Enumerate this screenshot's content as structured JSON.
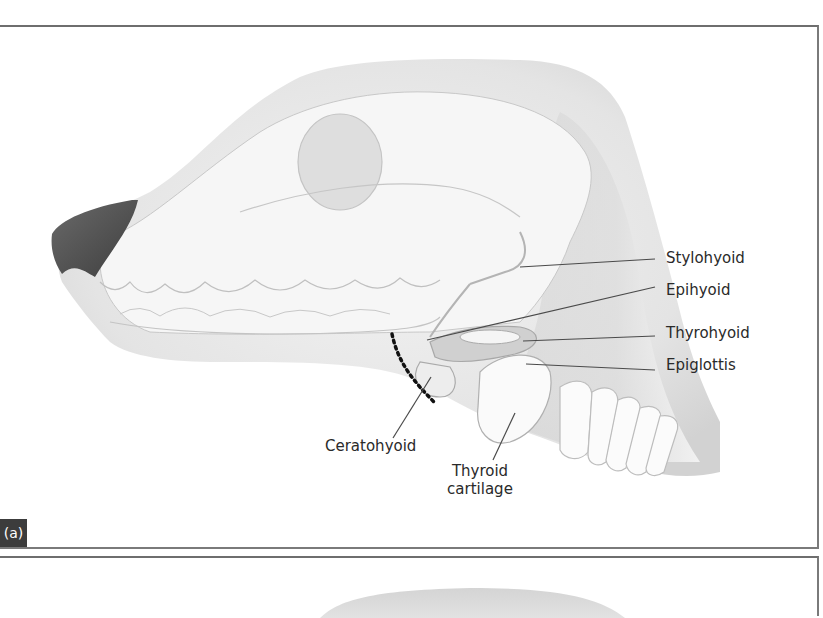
{
  "figure": {
    "panels": [
      {
        "id": "a",
        "badge": "(a)",
        "subject": "Dog head lateral view showing hyoid apparatus and larynx",
        "labels": {
          "stylohyoid": "Stylohyoid",
          "epihyoid": "Epihyoid",
          "thyrohyoid": "Thyrohyoid",
          "epiglottis": "Epiglottis",
          "ceratohyoid": "Ceratohyoid",
          "thyroid_line1": "Thyroid",
          "thyroid_line2": "cartilage"
        }
      },
      {
        "id": "b",
        "badge": "",
        "subject": "Second panel (partially visible)"
      }
    ],
    "colors": {
      "border": "#6e6e6e",
      "skin": "#d9d9d9",
      "skin_light": "#ececec",
      "nose": "#5a5a5a",
      "outline": "#b8b8b8",
      "leader_line": "#4a4a4a",
      "dotted_marker": "#111111",
      "badge_bg": "#3c3c3c",
      "badge_text": "#ffffff"
    }
  }
}
